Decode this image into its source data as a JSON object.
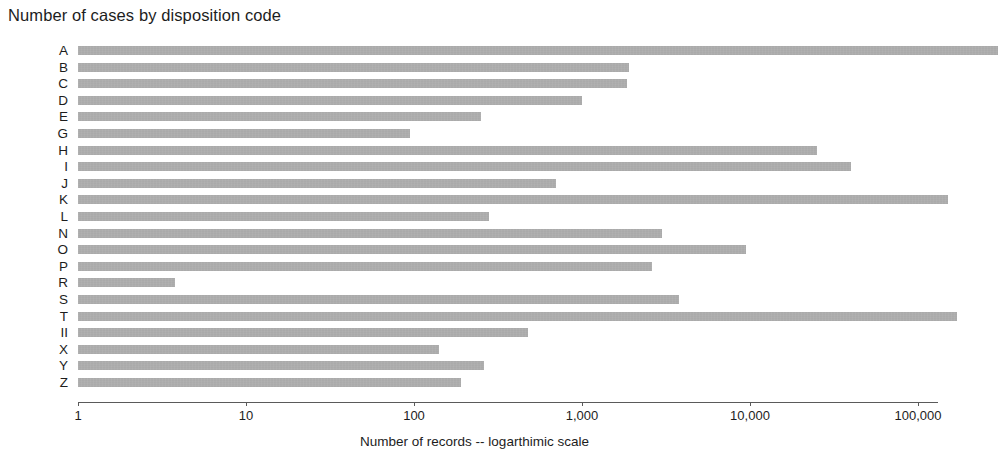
{
  "chart_data": {
    "type": "bar",
    "orientation": "horizontal",
    "title": "Number of cases by disposition code",
    "xlabel": "Number of records -- logarthimic scale",
    "ylabel": "",
    "xscale": "log",
    "xlim": [
      1,
      300000
    ],
    "grid": false,
    "legend": null,
    "bar_color": "#a9a9a9",
    "xticks": [
      1,
      10,
      100,
      1000,
      10000,
      100000
    ],
    "xticklabels": [
      "1",
      "10",
      "100",
      "1,000",
      "10,000",
      "100,000"
    ],
    "categories": [
      "A",
      "B",
      "C",
      "D",
      "E",
      "G",
      "H",
      "I",
      "J",
      "K",
      "L",
      "N",
      "O",
      "P",
      "R",
      "S",
      "T",
      "II",
      "X",
      "Y",
      "Z"
    ],
    "values": [
      300000,
      1900,
      1850,
      1000,
      250,
      95,
      25000,
      40000,
      700,
      150000,
      280,
      3000,
      9500,
      2600,
      3.8,
      3800,
      170000,
      480,
      140,
      260,
      190
    ],
    "bars": [
      {
        "label": "A",
        "value": 300000
      },
      {
        "label": "B",
        "value": 1900
      },
      {
        "label": "C",
        "value": 1850
      },
      {
        "label": "D",
        "value": 1000
      },
      {
        "label": "E",
        "value": 250
      },
      {
        "label": "G",
        "value": 95
      },
      {
        "label": "H",
        "value": 25000
      },
      {
        "label": "I",
        "value": 40000
      },
      {
        "label": "J",
        "value": 700
      },
      {
        "label": "K",
        "value": 150000
      },
      {
        "label": "L",
        "value": 280
      },
      {
        "label": "N",
        "value": 3000
      },
      {
        "label": "O",
        "value": 9500
      },
      {
        "label": "P",
        "value": 2600
      },
      {
        "label": "R",
        "value": 3.8
      },
      {
        "label": "S",
        "value": 3800
      },
      {
        "label": "T",
        "value": 170000
      },
      {
        "label": "II",
        "value": 480
      },
      {
        "label": "X",
        "value": 140
      },
      {
        "label": "Y",
        "value": 260
      },
      {
        "label": "Z",
        "value": 190
      }
    ]
  }
}
